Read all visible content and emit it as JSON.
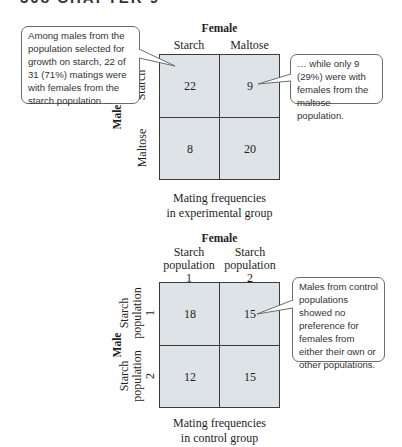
{
  "running_header": "308   CHAPTER 9",
  "experimental": {
    "female_title": "Female",
    "male_title": "Male",
    "columns": [
      "Starch",
      "Maltose"
    ],
    "rows": [
      "Starch",
      "Maltose"
    ],
    "cells": [
      [
        "22",
        "9"
      ],
      [
        "8",
        "20"
      ]
    ],
    "caption_line1": "Mating frequencies",
    "caption_line2": "in experimental group",
    "callout_left": "Among males from the population selected for growth on starch, 22 of 31 (71%) matings were with females from the starch population …",
    "callout_right": "… while only 9 (29%) were with females from the maltose population."
  },
  "control": {
    "female_title": "Female",
    "male_title": "Male",
    "columns": [
      {
        "line1": "Starch",
        "line2": "population",
        "line3": "1"
      },
      {
        "line1": "Starch",
        "line2": "population",
        "line3": "2"
      }
    ],
    "rows": [
      {
        "line1": "Starch",
        "line2": "population",
        "line3": "1"
      },
      {
        "line1": "Starch",
        "line2": "population",
        "line3": "2"
      }
    ],
    "cells": [
      [
        "18",
        "15"
      ],
      [
        "12",
        "15"
      ]
    ],
    "caption_line1": "Mating frequencies",
    "caption_line2": "in control group",
    "callout_right": "Males from control populations showed no preference for females from either their own or other populations."
  },
  "colors": {
    "cell_fill": "#dde3e6",
    "grid_line": "#3a3a3a",
    "callout_border": "#6b6b6b"
  }
}
